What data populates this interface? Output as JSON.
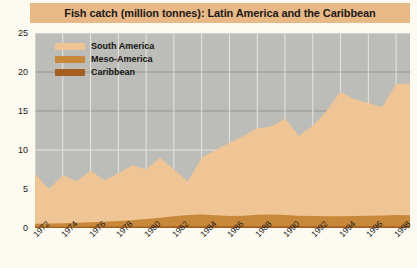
{
  "chart_title": "Fish catch (million tonnes): Latin America and the Caribbean",
  "colors": {
    "banner": "#E8B987",
    "page_background": "#FDFAF2",
    "plot_background": "#BCBCB8",
    "south_america": "#EFC596",
    "meso_america": "#C8883A",
    "caribbean": "#A55E22",
    "gridline": "#E8E6DF",
    "axis_text": "#1C1A17"
  },
  "legend": {
    "position": "top-left-inside",
    "items": [
      {
        "label": "South America",
        "color": "#EFC596"
      },
      {
        "label": "Meso-America",
        "color": "#C8883A"
      },
      {
        "label": "Caribbean",
        "color": "#A55E22"
      }
    ]
  },
  "axes": {
    "y_ticks": [
      "0",
      "5",
      "10",
      "15",
      "20",
      "25"
    ],
    "x_ticks": [
      "1972",
      "1974",
      "1976",
      "1978",
      "1980",
      "1982",
      "1984",
      "1986",
      "1988",
      "1990",
      "1992",
      "1994",
      "1996",
      "1998"
    ]
  },
  "chart_data": {
    "type": "area",
    "stacked": true,
    "title": "Fish catch (million tonnes): Latin America and the Caribbean",
    "xlabel": "",
    "ylabel": "million tonnes",
    "ylim": [
      0,
      25
    ],
    "xlim": [
      1972,
      1999
    ],
    "grid": true,
    "legend_position": "top-left-inside",
    "x": [
      1972,
      1973,
      1974,
      1975,
      1976,
      1977,
      1978,
      1979,
      1980,
      1981,
      1982,
      1983,
      1984,
      1985,
      1986,
      1987,
      1988,
      1989,
      1990,
      1991,
      1992,
      1993,
      1994,
      1995,
      1996,
      1997,
      1998,
      1999
    ],
    "series": [
      {
        "name": "Caribbean",
        "color": "#A55E22",
        "values": [
          0.15,
          0.15,
          0.16,
          0.17,
          0.18,
          0.18,
          0.19,
          0.2,
          0.2,
          0.21,
          0.21,
          0.22,
          0.22,
          0.23,
          0.23,
          0.23,
          0.24,
          0.24,
          0.24,
          0.23,
          0.23,
          0.22,
          0.22,
          0.22,
          0.21,
          0.21,
          0.21,
          0.21
        ]
      },
      {
        "name": "Meso-America",
        "color": "#C8883A",
        "values": [
          0.4,
          0.42,
          0.45,
          0.5,
          0.55,
          0.62,
          0.7,
          0.8,
          0.95,
          1.1,
          1.3,
          1.45,
          1.5,
          1.42,
          1.3,
          1.35,
          1.45,
          1.5,
          1.42,
          1.35,
          1.3,
          1.28,
          1.3,
          1.32,
          1.35,
          1.4,
          1.45,
          1.42
        ]
      },
      {
        "name": "South America",
        "color": "#EFC596",
        "values": [
          6.45,
          4.43,
          6.14,
          5.33,
          6.62,
          5.32,
          6.11,
          7.05,
          6.35,
          7.69,
          5.99,
          4.33,
          7.28,
          8.35,
          9.4,
          10.22,
          11.11,
          11.26,
          12.36,
          10.25,
          11.57,
          13.5,
          15.98,
          14.96,
          14.45,
          13.89,
          16.84,
          16.87
        ]
      }
    ],
    "totals": [
      7.0,
      5.0,
      6.75,
      6.0,
      7.35,
      6.12,
      7.0,
      8.05,
      7.5,
      9.0,
      7.5,
      6.0,
      9.0,
      10.0,
      10.93,
      11.8,
      12.8,
      13.0,
      14.02,
      11.83,
      13.1,
      15.0,
      17.5,
      16.5,
      16.01,
      15.5,
      18.5,
      18.5
    ],
    "peak": {
      "year": 1994,
      "value": 23.0
    }
  }
}
